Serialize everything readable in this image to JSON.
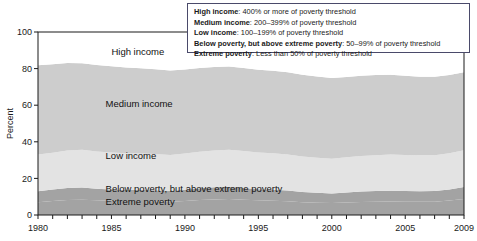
{
  "chart_data": {
    "type": "area",
    "title": "",
    "xlabel": "",
    "ylabel": "Percent",
    "xlim": [
      1980,
      2009
    ],
    "ylim": [
      0,
      100
    ],
    "ytick_values": [
      0,
      20,
      40,
      60,
      80,
      100
    ],
    "ytick_labels": [
      "0",
      "20",
      "40",
      "60",
      "80",
      "100"
    ],
    "xtick_labels": [
      "1980",
      "1985",
      "1990",
      "1995",
      "2000",
      "2005",
      "2009"
    ],
    "xtick_label_values": [
      1980,
      1985,
      1990,
      1995,
      2000,
      2005,
      2009
    ],
    "grid": false,
    "legend_position": "top-right-inset",
    "stacked": true,
    "stack_order_bottom_to_top": [
      "Extreme poverty",
      "Below poverty, but above extreme poverty",
      "Low income",
      "Medium income",
      "High income"
    ],
    "x": [
      1980,
      1981,
      1982,
      1983,
      1984,
      1985,
      1986,
      1987,
      1988,
      1989,
      1990,
      1991,
      1992,
      1993,
      1994,
      1995,
      1996,
      1997,
      1998,
      1999,
      2000,
      2001,
      2002,
      2003,
      2004,
      2005,
      2006,
      2007,
      2008,
      2009
    ],
    "series": [
      {
        "name": "Extreme poverty",
        "color": "#a3a3a3",
        "values": [
          7.0,
          7.6,
          8.2,
          8.4,
          8.0,
          7.8,
          7.6,
          7.6,
          7.5,
          7.3,
          7.7,
          8.2,
          8.5,
          8.7,
          8.4,
          8.0,
          7.8,
          7.5,
          7.0,
          6.7,
          6.5,
          6.8,
          7.1,
          7.3,
          7.4,
          7.3,
          7.2,
          7.3,
          7.9,
          8.7
        ]
      },
      {
        "name": "Below poverty, but above extreme poverty",
        "color": "#a3a3a3",
        "values": [
          6.0,
          6.3,
          6.6,
          6.6,
          6.3,
          6.2,
          6.1,
          6.1,
          6.0,
          5.9,
          6.1,
          6.4,
          6.6,
          6.7,
          6.4,
          6.1,
          6.0,
          5.9,
          5.6,
          5.4,
          5.3,
          5.5,
          5.7,
          5.8,
          5.9,
          5.8,
          5.8,
          5.8,
          6.1,
          6.6
        ]
      },
      {
        "name": "Low income",
        "color": "#e3e3e3",
        "values": [
          20.0,
          20.1,
          20.4,
          20.6,
          20.4,
          20.2,
          20.0,
          19.9,
          19.8,
          19.6,
          19.8,
          20.0,
          20.2,
          20.3,
          20.2,
          20.0,
          19.9,
          19.7,
          19.4,
          19.2,
          19.0,
          19.2,
          19.4,
          19.6,
          19.7,
          19.7,
          19.6,
          19.6,
          19.8,
          20.1
        ]
      },
      {
        "name": "Medium income",
        "color": "#cdcdcd",
        "values": [
          48.8,
          48.4,
          47.8,
          47.3,
          47.2,
          47.1,
          46.9,
          46.6,
          46.4,
          46.2,
          45.9,
          45.7,
          45.6,
          45.4,
          45.3,
          45.3,
          45.1,
          44.9,
          44.7,
          44.4,
          44.0,
          43.9,
          43.9,
          43.8,
          43.6,
          43.3,
          43.0,
          42.8,
          42.7,
          42.6
        ]
      },
      {
        "name": "High income",
        "color": "#ffffff",
        "values": [
          18.2,
          17.6,
          17.0,
          17.1,
          18.1,
          18.7,
          19.4,
          19.8,
          20.3,
          21.0,
          20.5,
          19.7,
          19.1,
          18.9,
          19.7,
          20.6,
          21.2,
          22.0,
          23.3,
          24.3,
          25.2,
          24.6,
          23.9,
          23.5,
          23.4,
          23.9,
          24.4,
          24.5,
          23.5,
          22.0
        ]
      }
    ],
    "band_labels": [
      {
        "text": "High income",
        "x": 1985.0,
        "y": 89.0
      },
      {
        "text": "Medium income",
        "x": 1984.6,
        "y": 60.5
      },
      {
        "text": "Low income",
        "x": 1984.6,
        "y": 32.5
      },
      {
        "text": "Below poverty, but above extreme poverty",
        "x": 1984.6,
        "y": 14.0
      },
      {
        "text": "Extreme poverty",
        "x": 1984.6,
        "y": 7.0
      }
    ],
    "legend_entries": [
      {
        "term": "High income",
        "desc": ": 400% or more of poverty threshold"
      },
      {
        "term": "Medium income",
        "desc": ": 200–399% of poverty threshold"
      },
      {
        "term": "Low income",
        "desc": ": 100–199% of poverty threshold"
      },
      {
        "term": "Below poverty, but above extreme poverty",
        "desc": ": 50–99% of poverty threshold"
      },
      {
        "term": "Extreme poverty",
        "desc": ": Less than 50% of poverty threshold"
      }
    ],
    "colors": {
      "high_income": "#ffffff",
      "medium_income": "#cdcdcd",
      "low_income": "#e3e3e3",
      "below_poverty": "#a3a3a3",
      "extreme_poverty": "#a3a3a3",
      "axis": "#1a1a1a",
      "legend_border": "#4a4a6a"
    }
  }
}
